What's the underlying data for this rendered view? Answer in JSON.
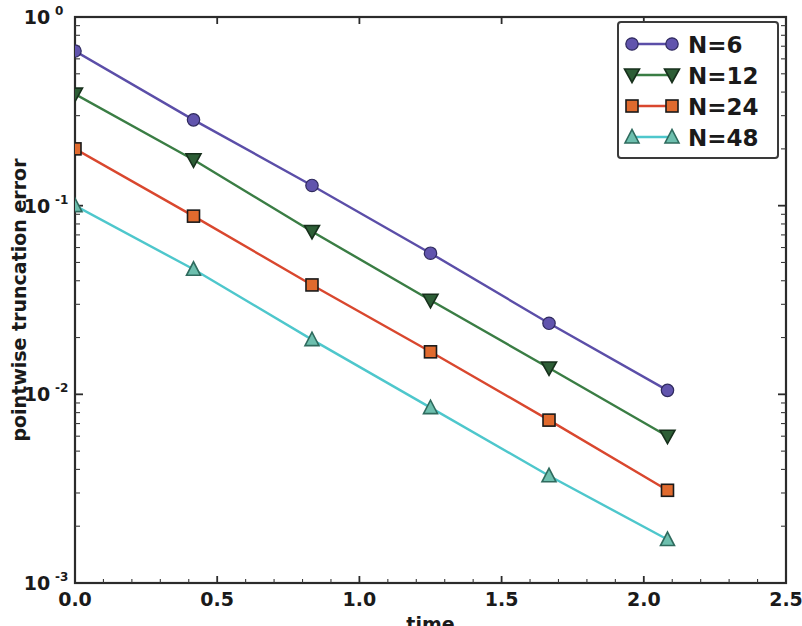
{
  "chart_data": {
    "type": "line",
    "title": "",
    "xlabel": "time",
    "ylabel": "pointwise truncation error",
    "xscale": "linear",
    "yscale": "log",
    "xlim": [
      0.0,
      2.5
    ],
    "ylim": [
      0.001,
      1.0
    ],
    "grid": false,
    "legend_position": "upper right",
    "x_ticks": [
      "0.0",
      "0.5",
      "1.0",
      "1.5",
      "2.0",
      "2.5"
    ],
    "x_tick_values": [
      0.0,
      0.5,
      1.0,
      1.5,
      2.0,
      2.5
    ],
    "y_ticks": [
      "10^0",
      "10^-1",
      "10^-2",
      "10^-3"
    ],
    "y_tick_mantissa": [
      "10",
      "10",
      "10",
      "10"
    ],
    "y_tick_exponent": [
      "0",
      "-1",
      "-2",
      "-3"
    ],
    "y_tick_values": [
      1.0,
      0.1,
      0.01,
      0.001
    ],
    "x": [
      0.0,
      0.4167,
      0.8333,
      1.25,
      1.6667,
      2.0833
    ],
    "series": [
      {
        "name": "N=6",
        "color": "#5b4ea8",
        "marker": "circle",
        "marker_color": "#6154ad",
        "values": [
          0.66,
          0.285,
          0.128,
          0.056,
          0.0238,
          0.0105
        ]
      },
      {
        "name": "N=12",
        "color": "#3a7d44",
        "marker": "triangle-down",
        "marker_color": "#2d5e36",
        "values": [
          0.39,
          0.175,
          0.073,
          0.0315,
          0.0138,
          0.006
        ]
      },
      {
        "name": "N=24",
        "color": "#d9472e",
        "marker": "square",
        "marker_color": "#e06a2e",
        "values": [
          0.2,
          0.088,
          0.038,
          0.0168,
          0.0073,
          0.0031
        ]
      },
      {
        "name": "N=48",
        "color": "#4ec7cc",
        "marker": "triangle-up",
        "marker_color": "#6dbfae",
        "values": [
          0.1,
          0.046,
          0.0195,
          0.0085,
          0.0037,
          0.0017
        ]
      }
    ]
  },
  "legend": {
    "entries": [
      {
        "label": "N=6"
      },
      {
        "label": "N=12"
      },
      {
        "label": "N=24"
      },
      {
        "label": "N=48"
      }
    ]
  },
  "axes": {
    "x_title": "time",
    "y_title": "pointwise truncation error"
  }
}
